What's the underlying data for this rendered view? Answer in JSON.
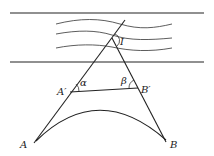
{
  "diagram": {
    "labels": {
      "intersection": "I",
      "point_a": "A",
      "point_b": "B",
      "point_a_prime": "A′",
      "point_b_prime": "B′",
      "angle_alpha": "α",
      "angle_beta": "β"
    },
    "colors": {
      "stroke": "#222222",
      "background": "#ffffff"
    }
  }
}
